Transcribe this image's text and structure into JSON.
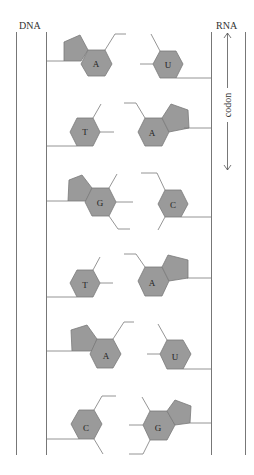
{
  "labels": {
    "dna": "DNA",
    "rna": "RNA",
    "codon": "codon"
  },
  "colors": {
    "base_fill": "#9a9a9a",
    "base_stroke": "#7a7a7a",
    "line": "#777777"
  },
  "pairs": [
    {
      "dna_base": "A",
      "dna_type": "purine",
      "rna_base": "U",
      "rna_type": "pyrimidine"
    },
    {
      "dna_base": "T",
      "dna_type": "pyrimidine",
      "rna_base": "A",
      "rna_type": "purine"
    },
    {
      "dna_base": "G",
      "dna_type": "purine",
      "rna_base": "C",
      "rna_type": "pyrimidine"
    },
    {
      "dna_base": "T",
      "dna_type": "pyrimidine",
      "rna_base": "A",
      "rna_type": "purine"
    },
    {
      "dna_base": "A",
      "dna_type": "purine",
      "rna_base": "U",
      "rna_type": "pyrimidine"
    },
    {
      "dna_base": "C",
      "dna_type": "pyrimidine",
      "rna_base": "G",
      "rna_type": "purine"
    }
  ]
}
